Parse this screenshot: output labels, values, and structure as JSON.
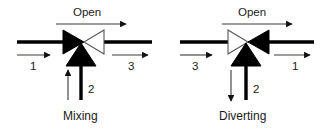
{
  "diagram": {
    "background_color": "#ffffff",
    "line_color": "#000000",
    "thin_line_color": "#3a3a3a",
    "text_color": "#1a1a1a",
    "figures": [
      {
        "id": "mixing-valve",
        "caption": "Mixing",
        "open_label": "Open",
        "open_arrow_direction": "right",
        "valve_left_triangle": "filled",
        "valve_right_triangle": "outlined",
        "valve_bottom_triangle": "filled",
        "ports": [
          {
            "id": "port-1",
            "label": "1",
            "position": "left",
            "flow_arrow_direction": "right"
          },
          {
            "id": "port-2",
            "label": "2",
            "position": "bottom",
            "flow_arrow_direction": "up"
          },
          {
            "id": "port-3",
            "label": "3",
            "position": "right",
            "flow_arrow_direction": "right"
          }
        ]
      },
      {
        "id": "diverting-valve",
        "caption": "Diverting",
        "open_label": "Open",
        "open_arrow_direction": "right",
        "valve_left_triangle": "outlined",
        "valve_right_triangle": "filled",
        "valve_bottom_triangle": "filled",
        "ports": [
          {
            "id": "port-3",
            "label": "3",
            "position": "left",
            "flow_arrow_direction": "right"
          },
          {
            "id": "port-2",
            "label": "2",
            "position": "bottom",
            "flow_arrow_direction": "down"
          },
          {
            "id": "port-1",
            "label": "1",
            "position": "right",
            "flow_arrow_direction": "right"
          }
        ]
      }
    ]
  }
}
